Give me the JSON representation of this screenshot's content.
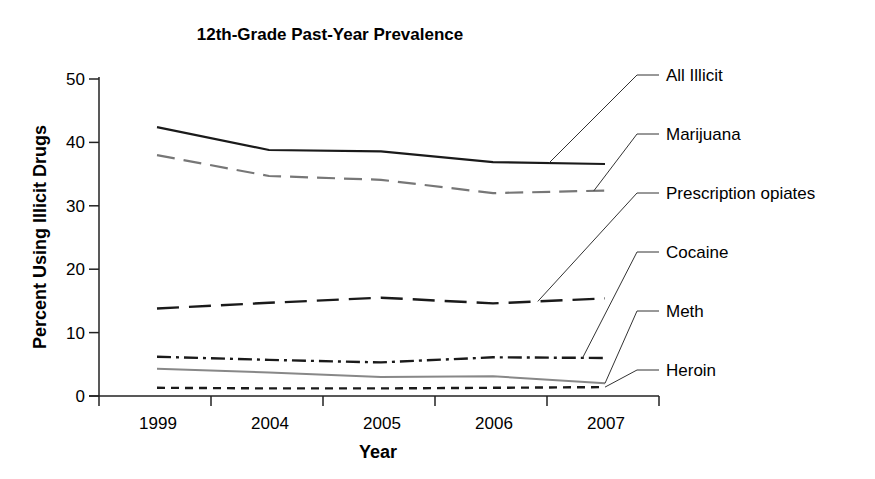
{
  "chart_data": {
    "type": "line",
    "title": "12th-Grade Past-Year Prevalence",
    "xlabel": "Year",
    "ylabel": "Percent Using Illicit Drugs",
    "categories": [
      "1999",
      "2004",
      "2005",
      "2006",
      "2007"
    ],
    "ylim": [
      0,
      50
    ],
    "yticks": [
      0,
      10,
      20,
      30,
      40,
      50
    ],
    "grid": false,
    "legend_placement": "right (callout labels)",
    "series": [
      {
        "name": "All Illicit",
        "values": [
          42.4,
          38.8,
          38.6,
          36.9,
          36.6
        ],
        "style": "solid",
        "color": "#1a1a1a"
      },
      {
        "name": "Marijuana",
        "values": [
          38.0,
          34.7,
          34.1,
          32.0,
          32.4
        ],
        "style": "dashed",
        "color": "#777777"
      },
      {
        "name": "Prescription opiates",
        "values": [
          13.8,
          14.7,
          15.5,
          14.6,
          15.4
        ],
        "style": "long-dash",
        "color": "#1a1a1a"
      },
      {
        "name": "Cocaine",
        "values": [
          6.2,
          5.7,
          5.3,
          6.1,
          6.0
        ],
        "style": "dash-dot",
        "color": "#1a1a1a"
      },
      {
        "name": "Meth",
        "values": [
          4.3,
          3.7,
          3.0,
          3.1,
          2.0
        ],
        "style": "solid-thin",
        "color": "#888888"
      },
      {
        "name": "Heroin",
        "values": [
          1.3,
          1.2,
          1.2,
          1.3,
          1.4
        ],
        "style": "short-dash",
        "color": "#1a1a1a"
      }
    ]
  }
}
